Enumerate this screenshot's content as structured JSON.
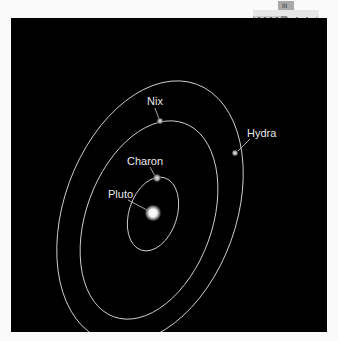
{
  "diagram": {
    "background_color": "#000000",
    "orbit_color": "#cfcfcf",
    "label_color": "#e8e8e8",
    "bodies": [
      {
        "name": "Pluto",
        "label": "Pluto",
        "role": "primary"
      },
      {
        "name": "Charon",
        "label": "Charon",
        "role": "moon"
      },
      {
        "name": "Nix",
        "label": "Nix",
        "role": "moon"
      },
      {
        "name": "Hydra",
        "label": "Hydra",
        "role": "moon"
      }
    ],
    "orbits": [
      {
        "moon": "Charon",
        "ring": "inner"
      },
      {
        "moon": "Nix",
        "ring": "middle"
      },
      {
        "moon": "Hydra",
        "ring": "outer"
      }
    ]
  },
  "widget": {
    "tab_icon": "bars-icon",
    "tab_glyph": "III",
    "scale_strip": "zigzag-scale",
    "tool_icon": "pointer-arrow-icon"
  }
}
